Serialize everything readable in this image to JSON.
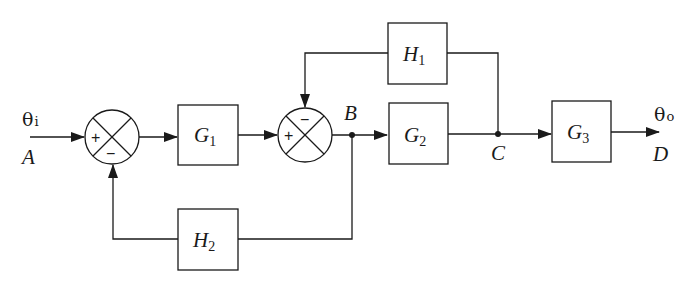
{
  "diagram": {
    "type": "block-diagram",
    "input": {
      "symbol": "θ",
      "subscript": "i",
      "node": "A"
    },
    "output": {
      "symbol": "θ",
      "subscript": "o",
      "node": "D"
    },
    "blocks": [
      {
        "id": "G1",
        "letter": "G",
        "subscript": "1"
      },
      {
        "id": "G2",
        "letter": "G",
        "subscript": "2"
      },
      {
        "id": "G3",
        "letter": "G",
        "subscript": "3"
      },
      {
        "id": "H1",
        "letter": "H",
        "subscript": "1"
      },
      {
        "id": "H2",
        "letter": "H",
        "subscript": "2"
      }
    ],
    "summing_junctions": [
      {
        "id": "S1",
        "plus": "+",
        "minus": "−"
      },
      {
        "id": "S2",
        "plus": "+",
        "minus": "−"
      }
    ],
    "nodes": {
      "B": "B",
      "C": "C"
    },
    "connections": [
      "A → S1(+)",
      "S1 → G1",
      "G1 → S2(+)",
      "S2 → B",
      "B → G2",
      "G2 → C",
      "C → G3",
      "G3 → D",
      "C → H1 → S2(−)",
      "B → H2 → S1(−)"
    ]
  }
}
